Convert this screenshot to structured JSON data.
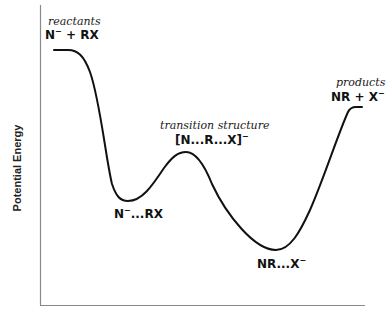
{
  "diagram": {
    "type": "reaction-energy-profile",
    "y_axis_label": "Potential Energy",
    "x_axis_label": "",
    "colors": {
      "curve": "#111111",
      "axis": "#777777",
      "text": "#111111"
    },
    "points": {
      "reactants": {
        "caption": "reactants",
        "formula_main": "N",
        "formula_sup": "−",
        "formula_rest": " + RX"
      },
      "intermediate1": {
        "formula_main": "N",
        "formula_sup": "−",
        "formula_rest": "...RX"
      },
      "transition_state": {
        "caption": "transition structure",
        "formula_main": "[N...R...X]",
        "formula_sup": "−"
      },
      "intermediate2": {
        "formula_main": "NR...X",
        "formula_sup": "−"
      },
      "products": {
        "caption": "products",
        "formula_main": "NR + X",
        "formula_sup": "−"
      }
    }
  }
}
